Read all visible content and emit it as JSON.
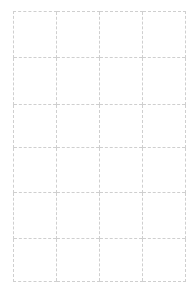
{
  "document": {
    "kind": "blank-grid-worksheet",
    "background_color": "#ffffff",
    "line_color": "#cfcfcf",
    "line_style": "dashed",
    "line_width_px": 1,
    "columns": 4,
    "rows": 6,
    "text_content": ""
  },
  "grid": {
    "left_px": 13,
    "top_px": 11,
    "right_px": 186,
    "bottom_px": 281,
    "vertical_line_x": [
      13,
      56,
      99,
      143,
      186
    ],
    "horizontal_line_y": [
      11,
      57,
      104,
      147,
      192,
      238,
      281
    ],
    "row_heights_px": [
      46,
      47,
      43,
      45,
      46,
      43
    ],
    "column_widths_px": [
      43,
      43,
      44,
      43
    ]
  },
  "cells": [
    [
      {
        "text": ""
      },
      {
        "text": ""
      },
      {
        "text": ""
      },
      {
        "text": ""
      }
    ],
    [
      {
        "text": ""
      },
      {
        "text": ""
      },
      {
        "text": ""
      },
      {
        "text": ""
      }
    ],
    [
      {
        "text": ""
      },
      {
        "text": ""
      },
      {
        "text": ""
      },
      {
        "text": ""
      }
    ],
    [
      {
        "text": ""
      },
      {
        "text": ""
      },
      {
        "text": ""
      },
      {
        "text": ""
      }
    ],
    [
      {
        "text": ""
      },
      {
        "text": ""
      },
      {
        "text": ""
      },
      {
        "text": ""
      }
    ],
    [
      {
        "text": ""
      },
      {
        "text": ""
      },
      {
        "text": ""
      },
      {
        "text": ""
      }
    ]
  ]
}
